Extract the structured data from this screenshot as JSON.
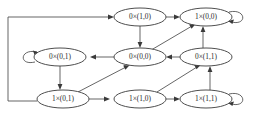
{
  "diagram": {
    "node_shape": "ellipse",
    "colors": {
      "node_fill": "#ffffff",
      "node_stroke": "#3a3a3a",
      "edge_stroke": "#4a4a4a",
      "arrow_fill": "#3a3a3a",
      "label_text": "#2a2a2a",
      "background": "#ffffff"
    },
    "nodes": [
      {
        "id": "n0x10",
        "label": "0×(1,0)",
        "cx": 140,
        "cy": 17,
        "rx": 26,
        "ry": 9,
        "self_loop": false
      },
      {
        "id": "n1x00",
        "label": "1×(0,0)",
        "cx": 206,
        "cy": 17,
        "rx": 26,
        "ry": 9,
        "self_loop": true,
        "loop_side": "right"
      },
      {
        "id": "n0x01",
        "label": "0×(0,1)",
        "cx": 60,
        "cy": 57,
        "rx": 26,
        "ry": 9,
        "self_loop": true,
        "loop_side": "left"
      },
      {
        "id": "n0x00",
        "label": "0×(0,0)",
        "cx": 140,
        "cy": 57,
        "rx": 26,
        "ry": 9,
        "self_loop": false
      },
      {
        "id": "n0x11",
        "label": "0×(1,1)",
        "cx": 206,
        "cy": 57,
        "rx": 26,
        "ry": 9,
        "self_loop": false
      },
      {
        "id": "n1x01",
        "label": "1×(0,1)",
        "cx": 63,
        "cy": 99,
        "rx": 26,
        "ry": 9,
        "self_loop": false
      },
      {
        "id": "n1x10",
        "label": "1×(1,0)",
        "cx": 140,
        "cy": 99,
        "rx": 26,
        "ry": 9,
        "self_loop": false
      },
      {
        "id": "n1x11",
        "label": "1×(1,1)",
        "cx": 206,
        "cy": 99,
        "rx": 26,
        "ry": 9,
        "self_loop": true,
        "loop_side": "right"
      }
    ],
    "edges": [
      {
        "from": "n0x10",
        "to": "n1x00",
        "kind": "horizontal"
      },
      {
        "from": "n0x10",
        "to": "n0x00",
        "kind": "vertical"
      },
      {
        "from": "n1x00",
        "to": "n1x00",
        "kind": "self-loop"
      },
      {
        "from": "n0x00",
        "to": "n0x01",
        "kind": "horizontal"
      },
      {
        "from": "n0x01",
        "to": "n0x01",
        "kind": "self-loop"
      },
      {
        "from": "n0x01",
        "to": "n1x01",
        "kind": "vertical"
      },
      {
        "from": "n0x11",
        "to": "n0x00",
        "kind": "horizontal"
      },
      {
        "from": "n0x11",
        "to": "n1x00",
        "kind": "vertical"
      },
      {
        "from": "n0x00",
        "to": "n1x00",
        "kind": "diagonal"
      },
      {
        "from": "n1x01",
        "to": "n0x00",
        "kind": "diagonal"
      },
      {
        "from": "n1x01",
        "to": "n1x10",
        "kind": "horizontal"
      },
      {
        "from": "n1x10",
        "to": "n1x11",
        "kind": "horizontal"
      },
      {
        "from": "n1x10",
        "to": "n0x11",
        "kind": "diagonal"
      },
      {
        "from": "n1x11",
        "to": "n0x11",
        "kind": "vertical"
      },
      {
        "from": "n1x11",
        "to": "n1x11",
        "kind": "self-loop"
      },
      {
        "from": "n1x01",
        "to": "n0x10",
        "kind": "wrap-around-left"
      }
    ]
  }
}
